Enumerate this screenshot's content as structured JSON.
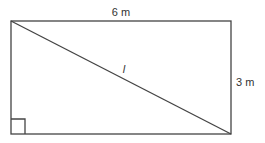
{
  "diagram": {
    "shape": "rectangle",
    "top_side_label": "6 m",
    "right_side_label": "3 m",
    "diagonal_label": "l",
    "right_angle_marker": "bottom-left",
    "stroke_color": "#444444",
    "background_color": "#ffffff"
  }
}
